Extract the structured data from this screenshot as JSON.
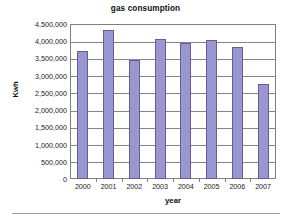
{
  "chart_data": {
    "type": "bar",
    "title": "gas consumption",
    "xlabel": "year",
    "ylabel": "Kwh",
    "categories": [
      "2000",
      "2001",
      "2002",
      "2003",
      "2004",
      "2005",
      "2006",
      "2007"
    ],
    "values": [
      3730000,
      4330000,
      3450000,
      4070000,
      3950000,
      4050000,
      3840000,
      2750000
    ],
    "ylim": [
      0,
      4500000
    ],
    "y_ticks": [
      0,
      500000,
      1000000,
      1500000,
      2000000,
      2500000,
      3000000,
      3500000,
      4000000,
      4500000
    ],
    "y_tick_labels": [
      "4,500,000",
      "4,000,000",
      "3,500,000",
      "3,000,000",
      "2,500,000",
      "2,000,000",
      "1,500,000",
      "1,000,000",
      "500,000",
      "0"
    ],
    "grid": true,
    "legend": false,
    "series": [
      {
        "name": "gas consumption",
        "values": [
          3730000,
          4330000,
          3450000,
          4070000,
          3950000,
          4050000,
          3840000,
          2750000
        ]
      }
    ],
    "colors": {
      "bar_fill": "#9a97cf",
      "bar_border": "#615e9e",
      "gridline": "#868686",
      "axis": "#7f7f7f",
      "background": "#ffffff",
      "text": "#1a1a1a",
      "footer_rule": "#9aa0a8"
    }
  }
}
